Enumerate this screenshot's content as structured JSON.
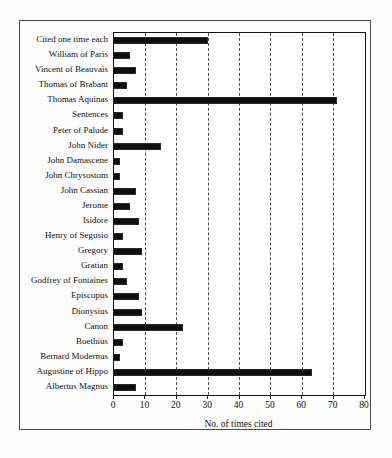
{
  "figure": {
    "xlabel": "No. of times cited"
  },
  "chart_data": {
    "type": "bar",
    "orientation": "horizontal",
    "title": "",
    "xlabel": "No. of times cited",
    "ylabel": "",
    "xlim": [
      0,
      80
    ],
    "xticks": [
      0,
      10,
      20,
      30,
      40,
      50,
      60,
      70,
      80
    ],
    "grid": "vertical-dashed",
    "bar_color": "#0e0e0e",
    "categories": [
      "Cited one time each",
      "William of Paris",
      "Vincent of Beauvais",
      "Thomas of Brabant",
      "Thomas Aquinas",
      "Sentences",
      "Peter of Palude",
      "John Nider",
      "John Damascene",
      "John Chrysostom",
      "John Cassian",
      "Jerome",
      "Isidore",
      "Henry of Segusio",
      "Gregory",
      "Gratian",
      "Godfrey of Fontaines",
      "Episcopus",
      "Dionysius",
      "Canon",
      "Boethius",
      "Bernard Modernus",
      "Augustine of Hippo",
      "Albertus Magnus"
    ],
    "values": [
      30,
      5,
      7,
      4,
      71,
      3,
      3,
      15,
      2,
      2,
      7,
      5,
      8,
      3,
      9,
      3,
      4,
      8,
      9,
      22,
      3,
      2,
      63,
      7
    ]
  }
}
